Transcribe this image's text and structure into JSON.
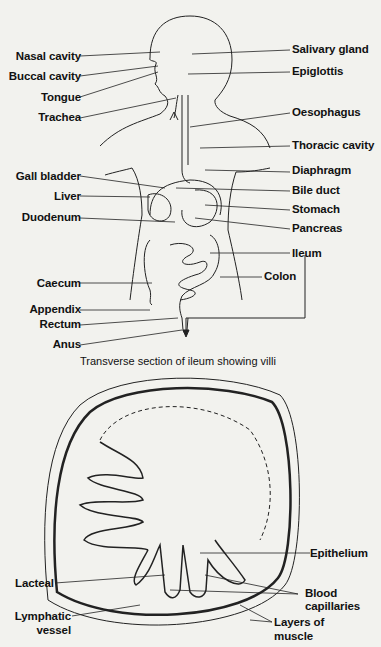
{
  "diagram": {
    "caption": "Transverse section of ileum showing villi",
    "left_labels": [
      "Nasal cavity",
      "Buccal cavity",
      "Tongue",
      "Trachea",
      "Gall bladder",
      "Liver",
      "Duodenum",
      "Caecum",
      "Appendix",
      "Rectum",
      "Anus"
    ],
    "right_labels": [
      "Salivary gland",
      "Epiglottis",
      "Oesophagus",
      "Thoracic cavity",
      "Diaphragm",
      "Bile duct",
      "Stomach",
      "Pancreas",
      "Ileum",
      "Colon"
    ],
    "section_labels": {
      "epithelium": "Epithelium",
      "lacteal": "Lacteal",
      "blood_capillaries": "Blood capillaries",
      "blood_line1": "Blood",
      "blood_line2": "capillaries",
      "lymphatic_line1": "Lymphatic",
      "lymphatic_line2": "vessel",
      "muscle_line1": "Layers of",
      "muscle_line2": "muscle"
    }
  }
}
